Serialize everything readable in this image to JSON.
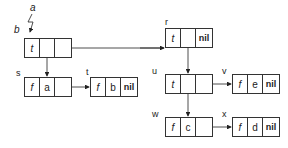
{
  "labels": {
    "a": "a",
    "b": "b"
  },
  "nodes": [
    {
      "id": "b",
      "name": "",
      "cells": [
        "t",
        "",
        ""
      ]
    },
    {
      "id": "r",
      "name": "r",
      "cells": [
        "t",
        "",
        "nil"
      ]
    },
    {
      "id": "s",
      "name": "s",
      "cells": [
        "f",
        "a",
        ""
      ]
    },
    {
      "id": "t",
      "name": "t",
      "cells": [
        "f",
        "b",
        "nil"
      ]
    },
    {
      "id": "u",
      "name": "u",
      "cells": [
        "t",
        "",
        ""
      ]
    },
    {
      "id": "v",
      "name": "v",
      "cells": [
        "f",
        "e",
        "nil"
      ]
    },
    {
      "id": "w",
      "name": "w",
      "cells": [
        "f",
        "c",
        ""
      ]
    },
    {
      "id": "x",
      "name": "x",
      "cells": [
        "f",
        "d",
        "nil"
      ]
    }
  ],
  "edges": [
    {
      "from": "b.left",
      "to": "s"
    },
    {
      "from": "b.right",
      "to": "r"
    },
    {
      "from": "s.right",
      "to": "t"
    },
    {
      "from": "r.left",
      "to": "u"
    },
    {
      "from": "u.left",
      "to": "w"
    },
    {
      "from": "u.right",
      "to": "v"
    },
    {
      "from": "w.right",
      "to": "x"
    }
  ]
}
